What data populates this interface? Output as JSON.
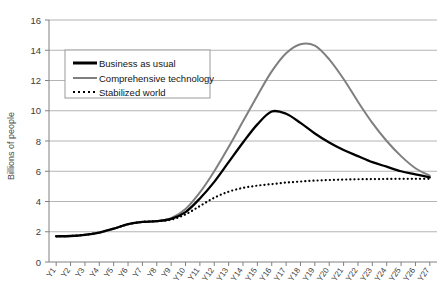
{
  "chart_data": {
    "type": "line",
    "title": "",
    "xlabel": "",
    "ylabel": "Billions of people",
    "ylim": [
      0,
      16
    ],
    "ytick_step": 2,
    "yticks": [
      "0",
      "2",
      "4",
      "6",
      "8",
      "10",
      "12",
      "14",
      "16"
    ],
    "grid": true,
    "grid_axis": "y",
    "legend_position": "upper-left-inside",
    "x": [
      "Y1",
      "Y2",
      "Y3",
      "Y4",
      "Y5",
      "Y6",
      "Y7",
      "Y8",
      "Y9",
      "Y10",
      "Y11",
      "Y12",
      "Y13",
      "Y14",
      "Y15",
      "Y16",
      "Y17",
      "Y18",
      "Y19",
      "Y20",
      "Y21",
      "Y22",
      "Y23",
      "Y24",
      "Y25",
      "Y26",
      "Y27"
    ],
    "series": [
      {
        "name": "Business as usual",
        "style": "solid",
        "color": "#000000",
        "width": 2.3,
        "values": [
          1.7,
          1.72,
          1.8,
          1.95,
          2.2,
          2.5,
          2.65,
          2.7,
          2.85,
          3.3,
          4.2,
          5.3,
          6.6,
          7.9,
          9.1,
          9.95,
          9.8,
          9.2,
          8.5,
          7.9,
          7.4,
          7.0,
          6.6,
          6.3,
          6.0,
          5.8,
          5.6
        ]
      },
      {
        "name": "Comprehensive technology",
        "style": "solid",
        "color": "#7f7f7f",
        "width": 2.0,
        "values": [
          1.7,
          1.72,
          1.8,
          1.95,
          2.2,
          2.5,
          2.65,
          2.7,
          2.9,
          3.5,
          4.6,
          6.0,
          7.6,
          9.3,
          11.0,
          12.6,
          13.8,
          14.4,
          14.3,
          13.4,
          12.1,
          10.6,
          9.2,
          8.0,
          7.0,
          6.2,
          5.7
        ]
      },
      {
        "name": "Stabilized world",
        "style": "dotted",
        "color": "#000000",
        "width": 2.2,
        "values": [
          1.7,
          1.72,
          1.8,
          1.95,
          2.2,
          2.5,
          2.65,
          2.7,
          2.8,
          3.15,
          3.7,
          4.25,
          4.65,
          4.9,
          5.05,
          5.15,
          5.25,
          5.32,
          5.38,
          5.42,
          5.45,
          5.47,
          5.48,
          5.49,
          5.5,
          5.5,
          5.5
        ]
      }
    ]
  },
  "legend": {
    "entries": [
      {
        "label": "Business as usual"
      },
      {
        "label": "Comprehensive technology"
      },
      {
        "label": "Stabilized world"
      }
    ]
  },
  "colors": {
    "business_as_usual": "#000000",
    "comprehensive_technology": "#7f7f7f",
    "stabilized_world": "#000000",
    "gridline": "#b4b4b4",
    "axis": "#808080",
    "legend_border": "#9a9a9a"
  }
}
